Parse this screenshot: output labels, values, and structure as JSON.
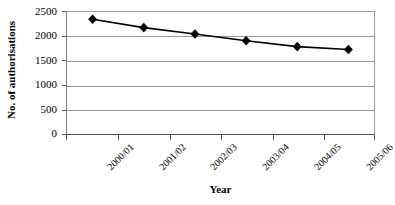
{
  "chart_data": {
    "type": "line",
    "title": "",
    "subtitle": "",
    "xlabel": "Year",
    "ylabel": "No. of authorisations",
    "categories": [
      "2000/01",
      "2001/02",
      "2002/03",
      "2003/04",
      "2004/05",
      "2005/06"
    ],
    "values": [
      2350,
      2180,
      2050,
      1910,
      1790,
      1730
    ],
    "series": [
      {
        "name": "No. of authorisations",
        "values": [
          2350,
          2180,
          2050,
          1910,
          1790,
          1730
        ]
      }
    ],
    "ylim": [
      0,
      2500
    ],
    "yticks": [
      0,
      500,
      1000,
      1500,
      2000,
      2500
    ],
    "ytick_labels": [
      "0",
      "500",
      "1000",
      "1500",
      "2000",
      "2500"
    ],
    "grid": "horizontal",
    "legend": "none",
    "marker": "diamond",
    "line_color": "#000000",
    "marker_color": "#000000",
    "grid_color": "#9a9a9a",
    "axis_color": "#555555",
    "background": "#ffffff",
    "x_tick_label_rotation": -45
  }
}
